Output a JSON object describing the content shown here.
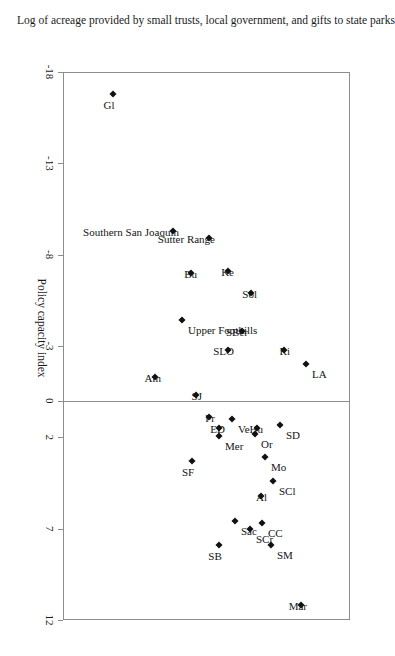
{
  "figure": {
    "orientation_note": "rotated-90-clockwise",
    "background": "#ffffff",
    "frame_color": "#8d8d8d",
    "marker_color": "#111111"
  },
  "chart_data": {
    "type": "scatter",
    "title": "",
    "xlabel": "Policy capacity index",
    "ylabel": "Log of acreage provided by small trusts, local government, and gifts to state parks",
    "xticks": [
      -18,
      -13,
      -8,
      -3,
      0,
      2,
      7,
      12
    ],
    "xticklabels": [
      "-18",
      "-13",
      "-8",
      "-3",
      "0",
      "2",
      "7",
      "12"
    ],
    "xlim": [
      -18,
      12
    ],
    "ylim": [
      0,
      100
    ],
    "grid": false,
    "legend": null,
    "zero_reference_line": 0,
    "points": [
      {
        "label": "Mar",
        "x": 11.2,
        "y": 83.0,
        "label_pos": "below"
      },
      {
        "label": "SM",
        "x": 7.9,
        "y": 72.5,
        "label_pos": "above"
      },
      {
        "label": "SB",
        "x": 7.9,
        "y": 54.5,
        "label_pos": "right"
      },
      {
        "label": "CC",
        "x": 6.7,
        "y": 69.5,
        "label_pos": "above"
      },
      {
        "label": "SCr",
        "x": 7.0,
        "y": 65.0,
        "label_pos": "above"
      },
      {
        "label": "Sac",
        "x": 6.6,
        "y": 60.0,
        "label_pos": "above"
      },
      {
        "label": "Al",
        "x": 5.2,
        "y": 69.0,
        "label_pos": "below"
      },
      {
        "label": "SCl",
        "x": 4.4,
        "y": 73.0,
        "label_pos": "above"
      },
      {
        "label": "Mo",
        "x": 3.1,
        "y": 70.5,
        "label_pos": "above"
      },
      {
        "label": "SF",
        "x": 3.3,
        "y": 45.0,
        "label_pos": "right"
      },
      {
        "label": "SD",
        "x": 1.3,
        "y": 75.5,
        "label_pos": "above"
      },
      {
        "label": "Hu",
        "x": 1.5,
        "y": 67.5,
        "label_pos": "below"
      },
      {
        "label": "Or",
        "x": 1.8,
        "y": 67.0,
        "label_pos": "above"
      },
      {
        "label": "Ve",
        "x": 1.0,
        "y": 59.0,
        "label_pos": "above"
      },
      {
        "label": "Mer",
        "x": 1.9,
        "y": 54.5,
        "label_pos": "above"
      },
      {
        "label": "ED",
        "x": 1.5,
        "y": 54.5,
        "label_pos": "below"
      },
      {
        "label": "Fr",
        "x": 0.9,
        "y": 51.0,
        "label_pos": "below"
      },
      {
        "label": "SJ",
        "x": -0.3,
        "y": 46.5,
        "label_pos": "below"
      },
      {
        "label": "Am",
        "x": -1.3,
        "y": 32.0,
        "label_pos": "below"
      },
      {
        "label": "LA",
        "x": -2.0,
        "y": 84.5,
        "label_pos": "above"
      },
      {
        "label": "Ri",
        "x": -2.8,
        "y": 77.0,
        "label_pos": "below"
      },
      {
        "label": "SLO",
        "x": -2.8,
        "y": 57.5,
        "label_pos": "below"
      },
      {
        "label": "SBer",
        "x": -3.8,
        "y": 62.5,
        "label_pos": "below"
      },
      {
        "label": "Upper Foothills",
        "x": -4.4,
        "y": 41.5,
        "label_pos": "above"
      },
      {
        "label": "Sol",
        "x": -5.9,
        "y": 65.5,
        "label_pos": "below"
      },
      {
        "label": "Ke",
        "x": -7.1,
        "y": 57.5,
        "label_pos": "below"
      },
      {
        "label": "Bu",
        "x": -7.0,
        "y": 44.5,
        "label_pos": "below"
      },
      {
        "label": "Sutter Range",
        "x": -8.9,
        "y": 51.0,
        "label_pos": "below"
      },
      {
        "label": "Southern San Joaquin",
        "x": -9.3,
        "y": 38.5,
        "label_pos": "below"
      },
      {
        "label": "Gl",
        "x": -16.8,
        "y": 17.5,
        "label_pos": "right"
      }
    ]
  }
}
